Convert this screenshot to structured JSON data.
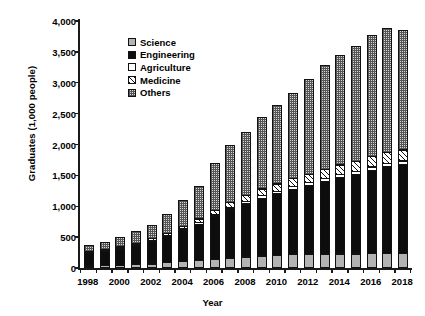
{
  "chart_data": {
    "type": "bar",
    "subtype": "stacked-bar",
    "title": "",
    "xlabel": "Year",
    "ylabel": "Graduates (1,000 people)",
    "ylim": [
      0,
      4000
    ],
    "ytick_values": [
      0,
      500,
      1000,
      1500,
      2000,
      2500,
      3000,
      3500,
      4000
    ],
    "ytick_labels": [
      "0",
      "500",
      "1,000",
      "1,500",
      "2,000",
      "2,500",
      "3,000",
      "3,500",
      "4,000"
    ],
    "grid": false,
    "legend_position": "upper-left-inside",
    "categories": [
      1998,
      1999,
      2000,
      2001,
      2002,
      2003,
      2004,
      2005,
      2006,
      2007,
      2008,
      2009,
      2010,
      2011,
      2012,
      2013,
      2014,
      2015,
      2016,
      2017,
      2018
    ],
    "xtick_labels": [
      "1998",
      "2000",
      "2002",
      "2004",
      "2006",
      "2008",
      "2010",
      "2012",
      "2014",
      "2016",
      "2018"
    ],
    "xtick_every": 2,
    "series": [
      {
        "name": "Science",
        "swatch": "dotted-gray",
        "color": "#b3b3b3",
        "values": [
          40,
          45,
          50,
          60,
          70,
          90,
          110,
          130,
          150,
          170,
          185,
          200,
          210,
          220,
          225,
          230,
          235,
          235,
          240,
          240,
          245
        ]
      },
      {
        "name": "Engineering",
        "swatch": "solid-black",
        "color": "#0d0d0d",
        "values": [
          210,
          240,
          275,
          320,
          380,
          440,
          520,
          600,
          700,
          790,
          870,
          950,
          1010,
          1070,
          1130,
          1190,
          1250,
          1300,
          1360,
          1420,
          1450
        ]
      },
      {
        "name": "Agriculture",
        "swatch": "white",
        "color": "#ffffff",
        "values": [
          15,
          18,
          20,
          22,
          26,
          30,
          34,
          38,
          42,
          46,
          50,
          52,
          55,
          58,
          60,
          62,
          64,
          66,
          68,
          70,
          72
        ]
      },
      {
        "name": "Medicine",
        "swatch": "diagonal-hatch",
        "color": "#ffffff",
        "values": [
          20,
          24,
          28,
          32,
          38,
          46,
          58,
          72,
          88,
          100,
          112,
          122,
          132,
          142,
          150,
          158,
          166,
          172,
          178,
          184,
          190
        ]
      },
      {
        "name": "Others",
        "swatch": "cross-hatch-gray",
        "color": "#d8d8d8",
        "values": [
          105,
          123,
          157,
          206,
          236,
          314,
          428,
          540,
          770,
          944,
          1033,
          1176,
          1293,
          1390,
          1555,
          1700,
          1785,
          1877,
          1974,
          2026,
          1943
        ]
      }
    ],
    "totals": [
      390,
      450,
      530,
      640,
      750,
      920,
      1150,
      1380,
      1750,
      2050,
      2250,
      2500,
      2700,
      2880,
      3120,
      3340,
      3500,
      3650,
      3820,
      3940,
      3900
    ]
  }
}
